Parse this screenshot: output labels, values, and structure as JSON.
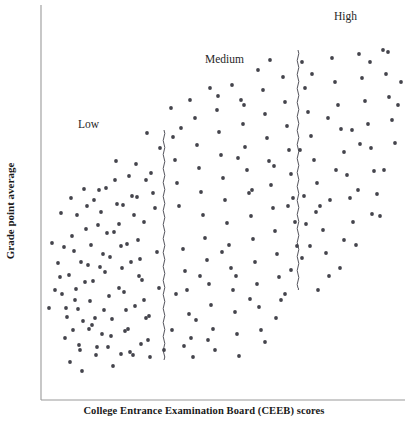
{
  "figure": {
    "width": 408,
    "height": 421,
    "background": "#ffffff"
  },
  "axes": {
    "x_title": "College Entrance Examination Board (CEEB) scores",
    "y_title": "Grade point average",
    "color": "#9a9a9a",
    "origin_x": 41,
    "origin_y": 400,
    "x_end": 405,
    "y_top": 5
  },
  "regions": [
    {
      "name": "low",
      "label": "Low",
      "x": 78,
      "y": 118
    },
    {
      "name": "medium",
      "label": "Medium",
      "x": 205,
      "y": 53
    },
    {
      "name": "high",
      "label": "High",
      "x": 334,
      "y": 10
    }
  ],
  "dividers": [
    {
      "name": "low-medium-divider",
      "x": 164,
      "y_top": 130,
      "y_bottom": 360,
      "style": "wavy"
    },
    {
      "name": "medium-high-divider",
      "x": 298,
      "y_top": 50,
      "y_bottom": 290,
      "style": "wavy"
    }
  ],
  "chart_data": {
    "type": "scatter",
    "title": "",
    "subtitle": "",
    "xlabel": "College Entrance Examination Board (CEEB) scores",
    "ylabel": "Grade point average",
    "xlim": [
      41,
      405
    ],
    "ylim": [
      400,
      5
    ],
    "grid": false,
    "legend": null,
    "axis_ticks": {
      "x": [],
      "y": []
    },
    "annotations": [
      {
        "text": "Low",
        "x": 78,
        "y": 118
      },
      {
        "text": "Medium",
        "x": 205,
        "y": 53
      },
      {
        "text": "High",
        "x": 334,
        "y": 10
      }
    ],
    "marker": {
      "shape": "circle",
      "radius": 1.9,
      "color": "#44444c"
    },
    "series": [
      {
        "name": "students",
        "description": "Positive correlation between CEEB scores and grade point average",
        "points": [
          [
            60,
            277
          ],
          [
            62,
            294
          ],
          [
            65,
            338
          ],
          [
            67,
            317
          ],
          [
            70,
            362
          ],
          [
            72,
            236
          ],
          [
            74,
            251
          ],
          [
            76,
            289
          ],
          [
            78,
            309
          ],
          [
            80,
            350
          ],
          [
            82,
            371
          ],
          [
            84,
            189
          ],
          [
            86,
            229
          ],
          [
            88,
            265
          ],
          [
            90,
            301
          ],
          [
            92,
            325
          ],
          [
            93,
            281
          ],
          [
            95,
            318
          ],
          [
            97,
            347
          ],
          [
            99,
            190
          ],
          [
            101,
            212
          ],
          [
            103,
            254
          ],
          [
            105,
            272
          ],
          [
            107,
            233
          ],
          [
            109,
            296
          ],
          [
            111,
            336
          ],
          [
            113,
            366
          ],
          [
            115,
            180
          ],
          [
            117,
            204
          ],
          [
            119,
            224
          ],
          [
            121,
            246
          ],
          [
            122,
            268
          ],
          [
            124,
            292
          ],
          [
            126,
            310
          ],
          [
            128,
            329
          ],
          [
            130,
            352
          ],
          [
            132,
            196
          ],
          [
            134,
            215
          ],
          [
            136,
            164
          ],
          [
            138,
            240
          ],
          [
            140,
            259
          ],
          [
            142,
            280
          ],
          [
            144,
            300
          ],
          [
            146,
            318
          ],
          [
            148,
            340
          ],
          [
            150,
            357
          ],
          [
            151,
            173
          ],
          [
            153,
            193
          ],
          [
            155,
            208
          ],
          [
            157,
            252
          ],
          [
            159,
            288
          ],
          [
            160,
            148
          ],
          [
            149,
            316
          ],
          [
            147,
            133
          ],
          [
            146,
            180
          ],
          [
            144,
            222
          ],
          [
            141,
            344
          ],
          [
            139,
            276
          ],
          [
            137,
            197
          ],
          [
            135,
            306
          ],
          [
            133,
            355
          ],
          [
            131,
            262
          ],
          [
            129,
            176
          ],
          [
            127,
            244
          ],
          [
            125,
            331
          ],
          [
            123,
            205
          ],
          [
            121,
            354
          ],
          [
            119,
            288
          ],
          [
            116,
            161
          ],
          [
            114,
            232
          ],
          [
            112,
            319
          ],
          [
            110,
            257
          ],
          [
            108,
            347
          ],
          [
            106,
            188
          ],
          [
            104,
            310
          ],
          [
            102,
            334
          ],
          [
            100,
            267
          ],
          [
            98,
            225
          ],
          [
            96,
            355
          ],
          [
            94,
            200
          ],
          [
            91,
            245
          ],
          [
            89,
            329
          ],
          [
            87,
            206
          ],
          [
            85,
            282
          ],
          [
            83,
            321
          ],
          [
            81,
            262
          ],
          [
            79,
            345
          ],
          [
            77,
            215
          ],
          [
            75,
            300
          ],
          [
            73,
            330
          ],
          [
            71,
            198
          ],
          [
            69,
            275
          ],
          [
            66,
            308
          ],
          [
            64,
            247
          ],
          [
            61,
            213
          ],
          [
            58,
            263
          ],
          [
            55,
            290
          ],
          [
            52,
            243
          ],
          [
            49,
            308
          ],
          [
            171,
            108
          ],
          [
            173,
            137
          ],
          [
            175,
            160
          ],
          [
            177,
            183
          ],
          [
            179,
            206
          ],
          [
            181,
            128
          ],
          [
            183,
            249
          ],
          [
            185,
            271
          ],
          [
            187,
            290
          ],
          [
            189,
            314
          ],
          [
            191,
            338
          ],
          [
            193,
            357
          ],
          [
            195,
            118
          ],
          [
            197,
            145
          ],
          [
            199,
            168
          ],
          [
            201,
            192
          ],
          [
            203,
            215
          ],
          [
            205,
            238
          ],
          [
            207,
            260
          ],
          [
            209,
            284
          ],
          [
            211,
            305
          ],
          [
            213,
            329
          ],
          [
            215,
            350
          ],
          [
            217,
            110
          ],
          [
            219,
            132
          ],
          [
            221,
            155
          ],
          [
            223,
            178
          ],
          [
            225,
            200
          ],
          [
            227,
            223
          ],
          [
            229,
            245
          ],
          [
            231,
            268
          ],
          [
            233,
            290
          ],
          [
            235,
            312
          ],
          [
            237,
            334
          ],
          [
            239,
            356
          ],
          [
            241,
            100
          ],
          [
            243,
            124
          ],
          [
            245,
            147
          ],
          [
            247,
            170
          ],
          [
            249,
            193
          ],
          [
            251,
            216
          ],
          [
            253,
            239
          ],
          [
            255,
            262
          ],
          [
            257,
            284
          ],
          [
            259,
            307
          ],
          [
            261,
            330
          ],
          [
            263,
            90
          ],
          [
            265,
            114
          ],
          [
            267,
            138
          ],
          [
            269,
            161
          ],
          [
            271,
            185
          ],
          [
            273,
            208
          ],
          [
            275,
            231
          ],
          [
            277,
            254
          ],
          [
            279,
            277
          ],
          [
            281,
            300
          ],
          [
            283,
            77
          ],
          [
            285,
            102
          ],
          [
            287,
            126
          ],
          [
            289,
            150
          ],
          [
            291,
            174
          ],
          [
            293,
            198
          ],
          [
            295,
            222
          ],
          [
            297,
            246
          ],
          [
            291,
            270
          ],
          [
            285,
            294
          ],
          [
            276,
            318
          ],
          [
            265,
            342
          ],
          [
            250,
            299
          ],
          [
            236,
            276
          ],
          [
            222,
            252
          ],
          [
            208,
            340
          ],
          [
            196,
            320
          ],
          [
            184,
            346
          ],
          [
            172,
            330
          ],
          [
            190,
            100
          ],
          [
            210,
            88
          ],
          [
            232,
            85
          ],
          [
            258,
            70
          ],
          [
            270,
            60
          ],
          [
            244,
            105
          ],
          [
            218,
            96
          ],
          [
            200,
            276
          ],
          [
            176,
            294
          ],
          [
            164,
            350
          ],
          [
            252,
            190
          ],
          [
            274,
            166
          ],
          [
            288,
            206
          ],
          [
            238,
            158
          ],
          [
            302,
            62
          ],
          [
            305,
            88
          ],
          [
            308,
            112
          ],
          [
            311,
            136
          ],
          [
            314,
            160
          ],
          [
            317,
            183
          ],
          [
            320,
            206
          ],
          [
            323,
            230
          ],
          [
            326,
            253
          ],
          [
            329,
            276
          ],
          [
            332,
            58
          ],
          [
            335,
            82
          ],
          [
            338,
            105
          ],
          [
            341,
            129
          ],
          [
            344,
            152
          ],
          [
            347,
            175
          ],
          [
            350,
            198
          ],
          [
            353,
            222
          ],
          [
            356,
            245
          ],
          [
            359,
            54
          ],
          [
            362,
            78
          ],
          [
            365,
            101
          ],
          [
            368,
            124
          ],
          [
            371,
            148
          ],
          [
            374,
            171
          ],
          [
            377,
            194
          ],
          [
            380,
            216
          ],
          [
            383,
            50
          ],
          [
            386,
            74
          ],
          [
            389,
            97
          ],
          [
            392,
            120
          ],
          [
            395,
            143
          ],
          [
            398,
            105
          ],
          [
            401,
            82
          ],
          [
            340,
            268
          ],
          [
            318,
            290
          ],
          [
            304,
            196
          ],
          [
            310,
            246
          ],
          [
            328,
            118
          ],
          [
            352,
            130
          ],
          [
            370,
            62
          ],
          [
            388,
            52
          ],
          [
            300,
            150
          ],
          [
            306,
            224
          ],
          [
            312,
            74
          ],
          [
            336,
            170
          ],
          [
            360,
            144
          ],
          [
            384,
            170
          ],
          [
            302,
            258
          ],
          [
            316,
            212
          ],
          [
            330,
            200
          ],
          [
            344,
            240
          ],
          [
            358,
            190
          ],
          [
            372,
            214
          ]
        ]
      }
    ]
  }
}
